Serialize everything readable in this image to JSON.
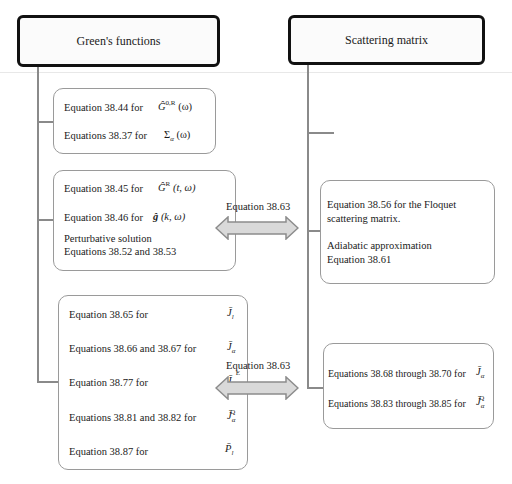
{
  "headers": {
    "left": "Green's functions",
    "right": "Scattering matrix"
  },
  "left_boxes": [
    {
      "lines": [
        {
          "text": "Equation 38.44 for",
          "symbol": "Ĝ",
          "sup": "0,R",
          "arg": "(ω)"
        },
        {
          "text": "Equations 38.37 for",
          "symbol": "Σ",
          "sub": "α",
          "arg": "(ω)"
        }
      ]
    },
    {
      "lines": [
        {
          "text": "Equation 38.45 for",
          "symbol": "Ĝ",
          "sup": "R",
          "arg": "(t, ω)"
        },
        {
          "text": "Equation 38.46 for",
          "symbol": "ĝ",
          "arg": "(k, ω)"
        },
        {
          "text": "Perturbative solution"
        },
        {
          "text": "Equations 38.52 and 38.53"
        }
      ]
    },
    {
      "lines": [
        {
          "text": "Equation 38.65 for",
          "symbol": "J̄",
          "sub": "l"
        },
        {
          "text": "Equations 38.66 and 38.67 for",
          "symbol": "J̄",
          "sub": "α"
        },
        {
          "text": "Equation 38.77 for",
          "symbol": "J̄",
          "sub": "l",
          "sup": "E"
        },
        {
          "text": "Equations 38.81 and 38.82 for",
          "symbol": "J̄",
          "sub": "α",
          "sup": "Q"
        },
        {
          "text": "Equation 38.87 for",
          "symbol": "P̄",
          "sub": "l"
        }
      ]
    }
  ],
  "right_boxes": [
    {
      "lines": [
        {
          "text": "Equation 38.56 for the Floquet"
        },
        {
          "text": "scattering matrix."
        },
        {
          "text": "Adiabatic approximation"
        },
        {
          "text": "Equation 38.61"
        }
      ]
    },
    {
      "lines": [
        {
          "text": "Equations 38.68 through 38.70 for",
          "symbol": "J̄",
          "sub": "α"
        },
        {
          "text": "Equations 38.83 through 38.85 for",
          "symbol": "J̄",
          "sub": "α",
          "sup": "Q"
        }
      ]
    }
  ],
  "arrows": [
    {
      "label": "Equation 38.63"
    },
    {
      "label": "Equation 38.63"
    }
  ],
  "colors": {
    "connector": "#8a8a8a",
    "box_border": "#9a9a9a",
    "header_border": "#111111",
    "arrow_fill": "#d9d9d9",
    "arrow_stroke": "#8c8c8c"
  }
}
